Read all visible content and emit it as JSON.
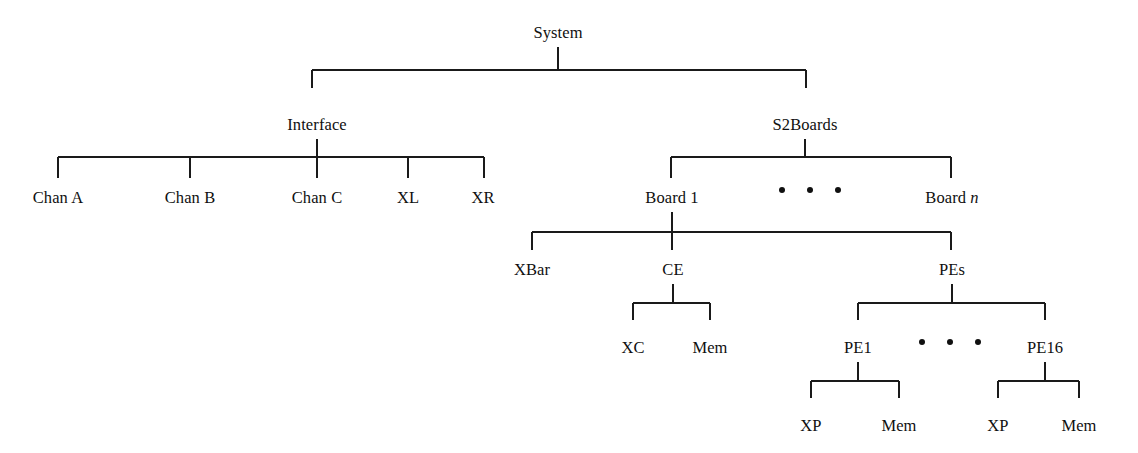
{
  "diagram": {
    "type": "tree",
    "canvas": {
      "width": 1138,
      "height": 453,
      "background": "#ffffff"
    },
    "line_color": "#1a1a1a",
    "text_color": "#101010",
    "nodes": {
      "system": {
        "label": "System",
        "x": 558,
        "y": 38
      },
      "interface": {
        "label": "Interface",
        "x": 317,
        "y": 130
      },
      "s2boards": {
        "label": "S2Boards",
        "x": 805,
        "y": 130
      },
      "chan_a": {
        "label": "Chan A",
        "x": 58,
        "y": 203
      },
      "chan_b": {
        "label": "Chan B",
        "x": 190,
        "y": 203
      },
      "chan_c": {
        "label": "Chan C",
        "x": 317,
        "y": 203
      },
      "xl": {
        "label": "XL",
        "x": 408,
        "y": 203
      },
      "xr": {
        "label": "XR",
        "x": 483,
        "y": 203
      },
      "board_1": {
        "label": "Board 1",
        "x": 672,
        "y": 203
      },
      "board_n": {
        "label": "Board ",
        "label_italic": "n",
        "x": 952,
        "y": 203
      },
      "xbar": {
        "label": "XBar",
        "x": 532,
        "y": 275
      },
      "ce": {
        "label": "CE",
        "x": 673,
        "y": 275
      },
      "pes": {
        "label": "PEs",
        "x": 952,
        "y": 275
      },
      "xc": {
        "label": "XC",
        "x": 633,
        "y": 353
      },
      "mem_ce": {
        "label": "Mem",
        "x": 710,
        "y": 353
      },
      "pe1": {
        "label": "PE1",
        "x": 858,
        "y": 353
      },
      "pe16": {
        "label": "PE16",
        "x": 1045,
        "y": 353
      },
      "xp_1": {
        "label": "XP",
        "x": 811,
        "y": 431
      },
      "mem_pe1": {
        "label": "Mem",
        "x": 899,
        "y": 431
      },
      "xp_16": {
        "label": "XP",
        "x": 998,
        "y": 431
      },
      "mem_pe16": {
        "label": "Mem",
        "x": 1079,
        "y": 431
      }
    },
    "connectors": [
      {
        "name": "system-to-children",
        "parent": "System",
        "children": [
          "Interface",
          "S2Boards"
        ],
        "stem_x": 558,
        "stem_top": 47,
        "bar_y": 70,
        "bar_left": 312,
        "bar_right": 806,
        "drops": [
          312,
          806
        ],
        "drop_bottom": 88
      },
      {
        "name": "interface-to-channels",
        "parent": "Interface",
        "children": [
          "Chan A",
          "Chan B",
          "Chan C",
          "XL",
          "XR"
        ],
        "stem_x": 317,
        "stem_top": 139,
        "bar_y": 157,
        "bar_left": 58,
        "bar_right": 484,
        "drops": [
          58,
          190,
          317,
          408,
          484
        ],
        "drop_bottom": 178
      },
      {
        "name": "s2boards-to-boards",
        "parent": "S2Boards",
        "children": [
          "Board 1",
          "Board n"
        ],
        "stem_x": 805,
        "stem_top": 139,
        "bar_y": 157,
        "bar_left": 671,
        "bar_right": 951,
        "drops": [
          671,
          951
        ],
        "drop_bottom": 178
      },
      {
        "name": "board1-to-units",
        "parent": "Board 1",
        "children": [
          "XBar",
          "CE",
          "PEs"
        ],
        "stem_x": 672,
        "stem_top": 212,
        "bar_y": 232,
        "bar_left": 532,
        "bar_right": 951,
        "drops": [
          532,
          672,
          951
        ],
        "drop_bottom": 250
      },
      {
        "name": "ce-to-parts",
        "parent": "CE",
        "children": [
          "XC",
          "Mem"
        ],
        "stem_x": 673,
        "stem_top": 284,
        "bar_y": 303,
        "bar_left": 633,
        "bar_right": 710,
        "drops": [
          633,
          710
        ],
        "drop_bottom": 320
      },
      {
        "name": "pes-to-pe",
        "parent": "PEs",
        "children": [
          "PE1",
          "PE16"
        ],
        "stem_x": 952,
        "stem_top": 284,
        "bar_y": 303,
        "bar_left": 858,
        "bar_right": 1045,
        "drops": [
          858,
          1045
        ],
        "drop_bottom": 320
      },
      {
        "name": "pe1-to-parts",
        "parent": "PE1",
        "children": [
          "XP",
          "Mem"
        ],
        "stem_x": 858,
        "stem_top": 362,
        "bar_y": 381,
        "bar_left": 811,
        "bar_right": 899,
        "drops": [
          811,
          899
        ],
        "drop_bottom": 398
      },
      {
        "name": "pe16-to-parts",
        "parent": "PE16",
        "children": [
          "XP",
          "Mem"
        ],
        "stem_x": 1045,
        "stem_top": 362,
        "bar_y": 381,
        "bar_left": 998,
        "bar_right": 1079,
        "drops": [
          998,
          1079
        ],
        "drop_bottom": 398
      }
    ],
    "ellipses": [
      {
        "name": "boards-ellipsis",
        "meaning": "more boards between Board 1 and Board n",
        "cy": 190,
        "r": 3.0,
        "cx": [
          782,
          810,
          838
        ]
      },
      {
        "name": "pes-ellipsis",
        "meaning": "more PEs between PE1 and PE16",
        "cy": 342,
        "r": 3.0,
        "cx": [
          922,
          950,
          978
        ]
      }
    ]
  }
}
